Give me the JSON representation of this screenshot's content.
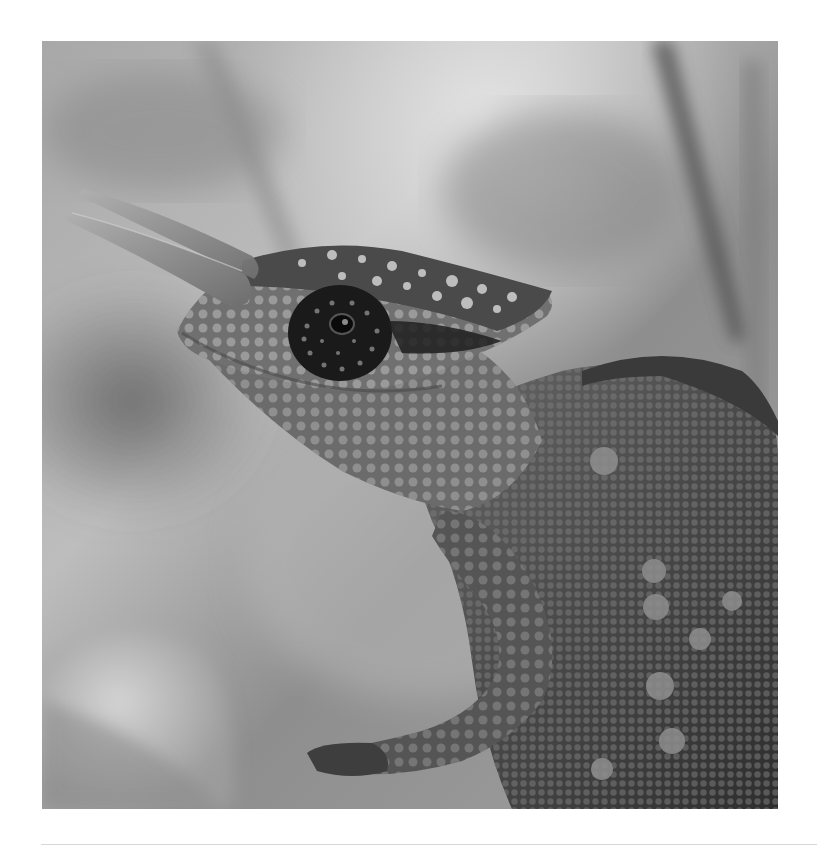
{
  "photo": {
    "alt": "Black and white close-up photograph of a Jackson's chameleon with horns, profile facing left, front leg raised, against a blurred background",
    "subject": "chameleon",
    "tone": "grayscale",
    "colors": {
      "background_light": "#c9c9c9",
      "background_mid": "#9a9a9a",
      "background_dark": "#6e6e6e",
      "skin_dark": "#3a3a3a",
      "skin_mid": "#5e5e5e",
      "scale_highlight": "#b8b8b8",
      "horn": "#8c8c8c",
      "eye": "#151515",
      "page_background": "#ffffff",
      "rule": "#d8d8d8"
    }
  }
}
